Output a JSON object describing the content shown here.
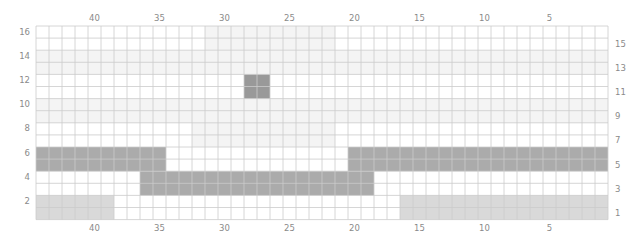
{
  "grid": {
    "columns": 44,
    "rows": 16,
    "column_numbering": "right-to-left",
    "row_numbering": "bottom-to-top",
    "column_labels": [
      40,
      35,
      30,
      25,
      20,
      15,
      10,
      5
    ],
    "left_row_labels": [
      16,
      14,
      12,
      10,
      8,
      6,
      4,
      2
    ],
    "right_row_labels": [
      15,
      13,
      11,
      9,
      7,
      5,
      3,
      1
    ],
    "colors": {
      "background": "#ffffff",
      "grid_line": "#cbcbcb",
      "faint": "#f4f4f4",
      "light": "#d9d9d9",
      "dark": "#ababab",
      "darker": "#999999",
      "label": "#8a8a8a"
    },
    "regions": [
      {
        "name": "faint-band-rows-13-14",
        "shade": "faint",
        "cols": [
          44,
          1
        ],
        "rows": [
          14,
          13
        ]
      },
      {
        "name": "faint-band-rows-9-10",
        "shade": "faint",
        "cols": [
          44,
          1
        ],
        "rows": [
          10,
          9
        ]
      },
      {
        "name": "faint-band-rows-15-16",
        "shade": "faint",
        "cols": [
          31,
          22
        ],
        "rows": [
          16,
          15
        ]
      },
      {
        "name": "faint-band-rows-7-8",
        "shade": "faint",
        "cols": [
          32,
          22
        ],
        "rows": [
          8,
          7
        ]
      },
      {
        "name": "light-band-left-rows-1-2",
        "shade": "light",
        "cols": [
          44,
          39
        ],
        "rows": [
          2,
          1
        ]
      },
      {
        "name": "light-band-right-rows-1-2",
        "shade": "light",
        "cols": [
          16,
          1
        ],
        "rows": [
          2,
          1
        ]
      },
      {
        "name": "dark-band-left-rows-5-6",
        "shade": "dark",
        "cols": [
          44,
          35
        ],
        "rows": [
          6,
          5
        ]
      },
      {
        "name": "dark-band-right-rows-5-6",
        "shade": "dark",
        "cols": [
          20,
          1
        ],
        "rows": [
          6,
          5
        ]
      },
      {
        "name": "dark-band-center-rows-3-4",
        "shade": "dark",
        "cols": [
          36,
          19
        ],
        "rows": [
          4,
          3
        ]
      },
      {
        "name": "dark-square-rows-11-12",
        "shade": "darker",
        "cols": [
          28,
          27
        ],
        "rows": [
          12,
          11
        ]
      }
    ]
  }
}
